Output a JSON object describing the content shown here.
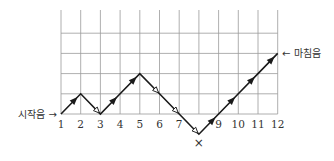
{
  "diagram": {
    "type": "melodic-contour-step-diagram",
    "start_label": "시작음 →",
    "end_label": "← 마침음",
    "x_ticks": [
      "1",
      "2",
      "3",
      "4",
      "5",
      "6",
      "7",
      "",
      "9",
      "10",
      "11",
      "12"
    ],
    "below_marker": "×",
    "below_marker_position": 8,
    "grid": {
      "columns": 11,
      "rows": 5
    },
    "path_levels": [
      0,
      1,
      0,
      1,
      2,
      1,
      0,
      -1,
      0,
      1,
      2,
      3
    ],
    "segment_markers": {
      "up": "filled-arrowhead",
      "down": "open-arrowhead"
    },
    "colors": {
      "grid": "#9a9a9a",
      "path": "#1a1a1a",
      "text": "#333333"
    }
  }
}
